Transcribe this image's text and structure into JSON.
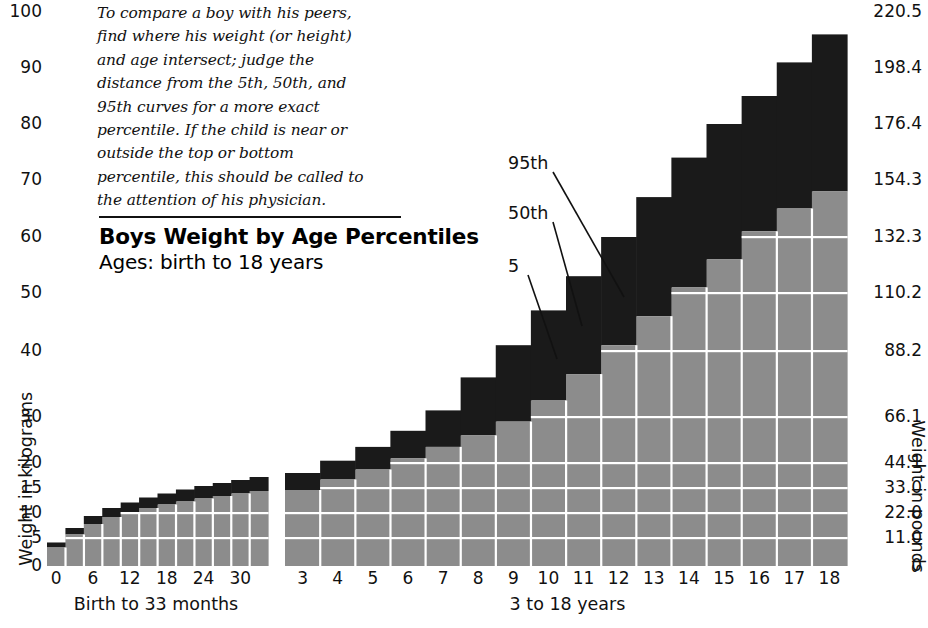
{
  "caption": {
    "text": "To compare a boy with his peers,\nfind where his weight (or height)\nand age intersect; judge the\ndistance from the 5th, 50th, and\n95th curves for a more exact\npercentile. If the child is near or\noutside the top or bottom\npercentile, this should be called to\nthe attention of his physician."
  },
  "title": "Boys Weight by Age Percentiles",
  "subtitle": "Ages: birth to 18 years",
  "axes": {
    "y_left_title": "Weight in kilograms",
    "y_right_title": "Weight in pounds",
    "y_left_ticks": [
      "100",
      "90",
      "80",
      "70",
      "60",
      "50",
      "40",
      "30",
      "20",
      "15",
      "10",
      "5",
      "0"
    ],
    "y_right_ticks": [
      "220.5",
      "198.4",
      "176.4",
      "154.3",
      "132.3",
      "110.2",
      "88.2",
      "66.1",
      "44.1",
      "33.0",
      "22.0",
      "11.0",
      "0"
    ],
    "x_infant_ticks": [
      "0",
      "6",
      "12",
      "18",
      "24",
      "30"
    ],
    "x_child_ticks": [
      "3",
      "4",
      "5",
      "6",
      "7",
      "8",
      "9",
      "10",
      "11",
      "12",
      "13",
      "14",
      "15",
      "16",
      "17",
      "18"
    ],
    "infant_range_label": "Birth to 33 months",
    "child_range_label": "3 to 18 years"
  },
  "callouts": [
    {
      "label": "95th"
    },
    {
      "label": "50th"
    },
    {
      "label": "5"
    }
  ],
  "colors": {
    "band_upper": "#1a1a1a",
    "band_lower": "#8c8c8c",
    "gridline": "#ffffff",
    "text": "#111111",
    "background": "#ffffff"
  },
  "chart_data": {
    "type": "bar",
    "title": "Boys Weight by Age Percentiles",
    "subtitle": "Ages: birth to 18 years",
    "xlabel": "Age",
    "ylabel": "Weight in kilograms",
    "ylabel_secondary": "Weight in pounds",
    "grid": true,
    "legend": [
      "5th percentile",
      "50th percentile",
      "95th percentile"
    ],
    "annotations": [
      "95th",
      "50th",
      "5"
    ],
    "y_axis_kg_ticks": [
      0,
      5,
      10,
      15,
      20,
      30,
      40,
      50,
      60,
      70,
      80,
      90,
      100
    ],
    "y_axis_lb_ticks": [
      0,
      11.0,
      22.0,
      33.0,
      44.1,
      66.1,
      88.2,
      110.2,
      132.3,
      154.3,
      176.4,
      198.4,
      220.5
    ],
    "y_axis_nonlinear": true,
    "kg_to_lb": 2.2046,
    "panels": [
      {
        "name": "infant",
        "range_label": "Birth to 33 months",
        "x_unit": "months",
        "categories": [
          0,
          3,
          6,
          9,
          12,
          15,
          18,
          21,
          24,
          27,
          30,
          33
        ],
        "tick_labels": [
          "0",
          "6",
          "12",
          "18",
          "24",
          "30"
        ],
        "series": [
          {
            "name": "5th percentile",
            "values": [
              2.5,
              4.5,
              6.2,
              7.4,
              8.3,
              9.0,
              9.6,
              10.1,
              10.6,
              11.1,
              11.5,
              11.9
            ]
          },
          {
            "name": "50th percentile",
            "values": [
              3.3,
              5.7,
              7.8,
              9.2,
              10.2,
              11.0,
              11.7,
              12.3,
              12.9,
              13.4,
              13.9,
              14.4
            ]
          },
          {
            "name": "95th percentile",
            "values": [
              4.2,
              7.0,
              9.4,
              11.0,
              12.1,
              13.1,
              13.9,
              14.7,
              15.4,
              16.0,
              16.6,
              17.2
            ]
          }
        ]
      },
      {
        "name": "child",
        "range_label": "3 to 18 years",
        "x_unit": "years",
        "categories": [
          3,
          4,
          5,
          6,
          7,
          8,
          9,
          10,
          11,
          12,
          13,
          14,
          15,
          16,
          17,
          18
        ],
        "tick_labels": [
          "3",
          "4",
          "5",
          "6",
          "7",
          "8",
          "9",
          "10",
          "11",
          "12",
          "13",
          "14",
          "15",
          "16",
          "17",
          "18"
        ],
        "series": [
          {
            "name": "5th percentile",
            "values": [
              12.1,
              13.6,
              15.3,
              17.0,
              19.0,
              21.0,
              23.0,
              25.0,
              28.0,
              31.0,
              35.0,
              39.0,
              43.0,
              47.0,
              50.0,
              53.0
            ]
          },
          {
            "name": "50th percentile",
            "values": [
              14.6,
              16.7,
              18.7,
              21.0,
              23.5,
              26.0,
              29.0,
              32.5,
              36.5,
              41.0,
              46.0,
              51.0,
              56.0,
              61.0,
              65.0,
              68.0
            ]
          },
          {
            "name": "95th percentile",
            "values": [
              18.0,
              20.5,
              23.5,
              27.0,
              31.0,
              36.0,
              41.0,
              47.0,
              53.0,
              60.0,
              67.0,
              74.0,
              80.0,
              85.0,
              91.0,
              96.0
            ]
          }
        ]
      }
    ]
  }
}
